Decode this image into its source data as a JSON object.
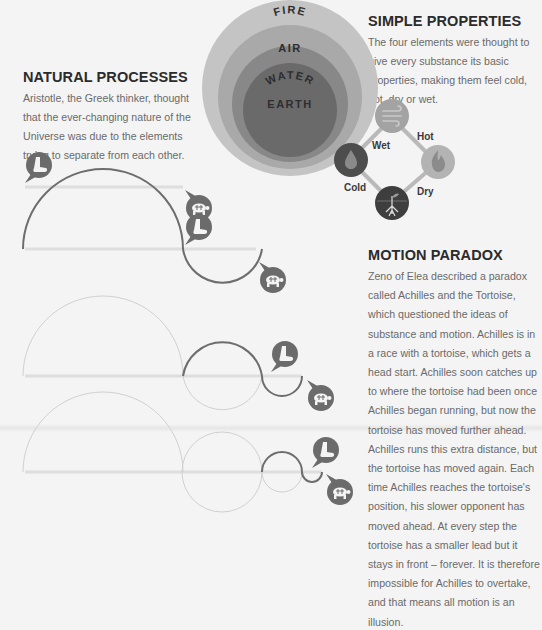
{
  "sections": {
    "natural_processes": {
      "title": "NATURAL PROCESSES",
      "body": "Aristotle, the Greek thinker, thought that the ever-changing nature of the Universe was due to the elements trying to separate from each other."
    },
    "simple_properties": {
      "title": "SIMPLE PROPERTIES",
      "body": "The four elements were thought to give every substance its basic properties, making them feel cold, hot, dry or wet."
    },
    "motion_paradox": {
      "title": "MOTION PARADOX",
      "body": "Zeno of Elea described a paradox called Achilles and the Tortoise, which questioned the ideas of substance and motion. Achilles is in a race with a tortoise, which gets a head start. Achilles soon catches up to where the tortoise had been once Achilles began running, but now the tortoise has moved further ahead. Achilles runs this extra distance, but the tortoise has moved again. Each time Achilles reaches the tortoise's position, his slower opponent has moved ahead. At every step the tortoise has a smaller lead but it stays in front – forever. It is therefore impossible for Achilles to overtake, and that means all motion is an illusion."
    }
  },
  "elements_rings": {
    "labels": [
      "FIRE",
      "AIR",
      "WATER",
      "EARTH"
    ],
    "colors": {
      "fire": "#c4c4c4",
      "air": "#a9a9a9",
      "water": "#888888",
      "earth": "#6a6a6a"
    }
  },
  "properties_diamond": {
    "nodes": [
      {
        "element": "air",
        "icon": "wind-icon"
      },
      {
        "element": "fire",
        "icon": "flame-icon"
      },
      {
        "element": "water",
        "icon": "droplet-icon"
      },
      {
        "element": "earth",
        "icon": "sprout-roots-icon"
      }
    ],
    "edge_labels": {
      "wet": "Wet",
      "hot": "Hot",
      "cold": "Cold",
      "dry": "Dry"
    }
  },
  "race_diagram": {
    "rows": 4,
    "runner_icon": "achilles-boot-icon",
    "tortoise_icon": "tortoise-icon",
    "colors": {
      "track": "#dedede",
      "active_arc": "#6d6d6d",
      "past_arc": "#d0d0d0",
      "bubble": "#6b6b6b"
    }
  }
}
